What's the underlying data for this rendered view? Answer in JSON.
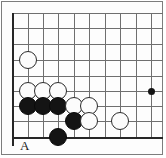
{
  "figure": {
    "kind": "go-board-diagram",
    "width": 166,
    "height": 158,
    "background_color": "#ffffff",
    "frame_color": "#7d7d7d"
  },
  "board": {
    "grid_color": "#6f6f6f",
    "edge_color": "#262626",
    "cell_size": 15.3,
    "origin_x": 12,
    "origin_y": 13,
    "columns": 10,
    "rows": 9,
    "vertical_line_x": [
      12,
      28,
      43,
      58,
      74,
      89,
      105,
      120,
      136,
      151
    ],
    "horizontal_line_y": [
      13,
      28,
      44,
      60,
      76,
      91,
      106,
      121,
      137
    ],
    "left_edge_index": 0,
    "bottom_edge_index": 8,
    "left_edge_is_board_border": true,
    "bottom_edge_is_board_border": true
  },
  "stones": [
    {
      "color": "white",
      "cx": 28,
      "cy": 60,
      "r": 9,
      "name": "white-stone-a"
    },
    {
      "color": "white",
      "cx": 28,
      "cy": 91,
      "r": 9,
      "name": "white-stone-b"
    },
    {
      "color": "white",
      "cx": 43,
      "cy": 91,
      "r": 9,
      "name": "white-stone-c"
    },
    {
      "color": "white",
      "cx": 58,
      "cy": 91,
      "r": 9,
      "name": "white-stone-d"
    },
    {
      "color": "black",
      "cx": 28,
      "cy": 106,
      "r": 9,
      "name": "black-stone-a"
    },
    {
      "color": "black",
      "cx": 43,
      "cy": 106,
      "r": 9,
      "name": "black-stone-b"
    },
    {
      "color": "black",
      "cx": 58,
      "cy": 106,
      "r": 9,
      "name": "black-stone-c"
    },
    {
      "color": "white",
      "cx": 74,
      "cy": 106,
      "r": 9,
      "name": "white-stone-e"
    },
    {
      "color": "white",
      "cx": 89,
      "cy": 106,
      "r": 9,
      "name": "white-stone-f"
    },
    {
      "color": "black",
      "cx": 74,
      "cy": 121,
      "r": 9,
      "name": "black-stone-d"
    },
    {
      "color": "white",
      "cx": 89,
      "cy": 121,
      "r": 9,
      "name": "white-stone-g"
    },
    {
      "color": "white",
      "cx": 120,
      "cy": 121,
      "r": 9,
      "name": "white-stone-h"
    },
    {
      "color": "black",
      "cx": 58,
      "cy": 137,
      "r": 9,
      "name": "black-stone-e"
    }
  ],
  "markers": [
    {
      "type": "hoshi",
      "cx": 151,
      "cy": 91,
      "r": 3.5,
      "color": "#141414",
      "name": "hoshi-star-point"
    }
  ],
  "labels": [
    {
      "text": "A",
      "x": 20,
      "y": 139,
      "name": "point-label-a"
    }
  ]
}
